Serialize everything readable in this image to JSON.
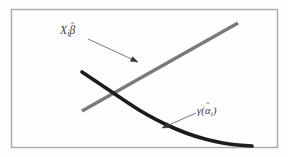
{
  "figure": {
    "background_color": "#fefefe",
    "frame": {
      "color": "#a9a9a9",
      "x": 11,
      "y": 9,
      "width": 266,
      "height": 138
    },
    "labels": {
      "linear_term": {
        "text": "Xᵢβ̂",
        "base": "X",
        "subscript": "i",
        "symbol": "β",
        "accent": "ˆ",
        "x": 60,
        "y": 25,
        "color": "#3a3a3a"
      },
      "nonlinear_term": {
        "text": "γ(α̂ᵢ)",
        "open_paren": "(",
        "symbol": "γ",
        "inner_symbol": "α",
        "accent": "ˆ",
        "subscript": "i",
        "close_paren": ")",
        "x": 197,
        "y": 106,
        "color": "#3a3a3a"
      }
    },
    "series": [
      {
        "name": "linear-index-line",
        "role": "X_i beta-hat",
        "type": "line",
        "color": "#7a7a7a",
        "stroke_width": 3.4,
        "points": [
          [
            82,
            111
          ],
          [
            238,
            23
          ]
        ]
      },
      {
        "name": "gamma-alpha-curve",
        "role": "gamma(alpha-hat_i)",
        "type": "curve",
        "color": "#1c1c1c",
        "stroke_width": 3.6,
        "points": [
          [
            82,
            72
          ],
          [
            112,
            92
          ],
          [
            146,
            115
          ],
          [
            186,
            134
          ],
          [
            224,
            144
          ],
          [
            252,
            146
          ]
        ]
      }
    ],
    "annotations": [
      {
        "name": "arrow-to-line",
        "color": "#555555",
        "stroke_width": 0.8,
        "from": [
          88,
          39
        ],
        "to": [
          138,
          62
        ]
      },
      {
        "name": "arrow-to-curve",
        "color": "#555555",
        "stroke_width": 0.8,
        "from": [
          196,
          113
        ],
        "to": [
          162,
          128
        ]
      }
    ]
  }
}
